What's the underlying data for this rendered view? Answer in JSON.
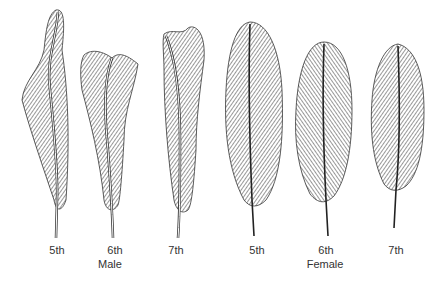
{
  "figure": {
    "feathers": [
      {
        "id": "male-5th",
        "label": "5th",
        "group": "Male"
      },
      {
        "id": "male-6th",
        "label": "6th",
        "group": "Male"
      },
      {
        "id": "male-7th",
        "label": "7th",
        "group": "Male"
      },
      {
        "id": "female-5th",
        "label": "5th",
        "group": "Female"
      },
      {
        "id": "female-6th",
        "label": "6th",
        "group": "Female"
      },
      {
        "id": "female-7th",
        "label": "7th",
        "group": "Female"
      }
    ],
    "groups": {
      "male": "Male",
      "female": "Female"
    },
    "colors": {
      "ink": "#2a2a2a",
      "background": "#ffffff"
    }
  }
}
